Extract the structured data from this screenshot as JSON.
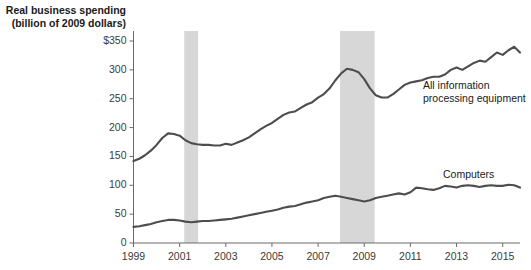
{
  "chart_data": {
    "type": "line",
    "title": "Real business spending\n(billion of 2009 dollars)",
    "ylabel": "Real business spending (billion of 2009 dollars)",
    "xlabel": "",
    "ylim": [
      0,
      350
    ],
    "xlim": [
      1999,
      2015.75
    ],
    "grid": false,
    "legend_position": "inline-annotation",
    "y_ticks": [
      "0",
      "50",
      "100",
      "150",
      "200",
      "250",
      "300",
      "$350"
    ],
    "y_tick_values": [
      0,
      50,
      100,
      150,
      200,
      250,
      300,
      350
    ],
    "x_ticks": [
      "1999",
      "2001",
      "2003",
      "2005",
      "2007",
      "2009",
      "2011",
      "2013",
      "2015"
    ],
    "x_tick_values": [
      1999,
      2001,
      2003,
      2005,
      2007,
      2009,
      2011,
      2013,
      2015
    ],
    "annotations": [
      {
        "text": "All information\nprocessing equipment",
        "series": "All information processing equipment"
      },
      {
        "text": "Computers",
        "series": "Computers"
      }
    ],
    "shaded_regions": [
      {
        "label": "recession-2001",
        "x_start": 2001.2,
        "x_end": 2001.8,
        "color": "#d7d7d7"
      },
      {
        "label": "recession-2008",
        "x_start": 2007.95,
        "x_end": 2009.45,
        "color": "#d7d7d7"
      }
    ],
    "series": [
      {
        "name": "All information processing equipment",
        "color": "#4d4d4d",
        "x": [
          1999.0,
          1999.25,
          1999.5,
          1999.75,
          2000.0,
          2000.25,
          2000.5,
          2000.75,
          2001.0,
          2001.25,
          2001.5,
          2001.75,
          2002.0,
          2002.25,
          2002.5,
          2002.75,
          2003.0,
          2003.25,
          2003.5,
          2003.75,
          2004.0,
          2004.25,
          2004.5,
          2004.75,
          2005.0,
          2005.25,
          2005.5,
          2005.75,
          2006.0,
          2006.25,
          2006.5,
          2006.75,
          2007.0,
          2007.25,
          2007.5,
          2007.75,
          2008.0,
          2008.25,
          2008.5,
          2008.75,
          2009.0,
          2009.25,
          2009.5,
          2009.75,
          2010.0,
          2010.25,
          2010.5,
          2010.75,
          2011.0,
          2011.25,
          2011.5,
          2011.75,
          2012.0,
          2012.25,
          2012.5,
          2012.75,
          2013.0,
          2013.25,
          2013.5,
          2013.75,
          2014.0,
          2014.25,
          2014.5,
          2014.75,
          2015.0,
          2015.25,
          2015.5,
          2015.75
        ],
        "values": [
          142,
          146,
          152,
          160,
          170,
          182,
          190,
          189,
          186,
          178,
          173,
          171,
          170,
          170,
          169,
          169,
          172,
          170,
          174,
          178,
          183,
          190,
          197,
          203,
          208,
          215,
          222,
          226,
          228,
          234,
          240,
          244,
          252,
          258,
          268,
          282,
          294,
          302,
          300,
          296,
          284,
          268,
          256,
          252,
          252,
          258,
          266,
          274,
          278,
          280,
          282,
          286,
          288,
          288,
          292,
          300,
          304,
          300,
          306,
          312,
          316,
          314,
          322,
          330,
          326,
          334,
          340,
          330
        ]
      },
      {
        "name": "Computers",
        "color": "#4d4d4d",
        "x": [
          1999.0,
          1999.25,
          1999.5,
          1999.75,
          2000.0,
          2000.25,
          2000.5,
          2000.75,
          2001.0,
          2001.25,
          2001.5,
          2001.75,
          2002.0,
          2002.25,
          2002.5,
          2002.75,
          2003.0,
          2003.25,
          2003.5,
          2003.75,
          2004.0,
          2004.25,
          2004.5,
          2004.75,
          2005.0,
          2005.25,
          2005.5,
          2005.75,
          2006.0,
          2006.25,
          2006.5,
          2006.75,
          2007.0,
          2007.25,
          2007.5,
          2007.75,
          2008.0,
          2008.25,
          2008.5,
          2008.75,
          2009.0,
          2009.25,
          2009.5,
          2009.75,
          2010.0,
          2010.25,
          2010.5,
          2010.75,
          2011.0,
          2011.25,
          2011.5,
          2011.75,
          2012.0,
          2012.25,
          2012.5,
          2012.75,
          2013.0,
          2013.25,
          2013.5,
          2013.75,
          2014.0,
          2014.25,
          2014.5,
          2014.75,
          2015.0,
          2015.25,
          2015.5,
          2015.75
        ],
        "values": [
          28,
          29,
          31,
          33,
          36,
          38,
          40,
          40,
          39,
          37,
          36,
          37,
          38,
          38,
          39,
          40,
          41,
          42,
          44,
          46,
          48,
          50,
          52,
          54,
          56,
          58,
          61,
          63,
          64,
          67,
          70,
          72,
          74,
          78,
          80,
          82,
          80,
          78,
          76,
          74,
          72,
          74,
          78,
          80,
          82,
          84,
          86,
          84,
          88,
          96,
          95,
          93,
          92,
          95,
          99,
          98,
          96,
          99,
          100,
          99,
          97,
          99,
          100,
          99,
          99,
          101,
          100,
          96
        ]
      }
    ]
  }
}
